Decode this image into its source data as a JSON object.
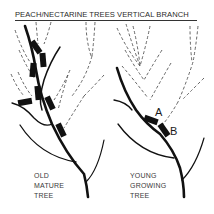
{
  "title": "PEACH/NECTARINE TREES VERTICAL BRANCH",
  "left_tree": {
    "caption_lines": [
      "OLD",
      "MATURE",
      "TREE"
    ]
  },
  "right_tree": {
    "caption_lines": [
      "YOUNG",
      "GROWING",
      "TREE"
    ],
    "markers": {
      "a": "A",
      "b": "B"
    }
  },
  "colors": {
    "ink": "#1a1a1a",
    "dashed": "#555555",
    "background": "#ffffff"
  }
}
